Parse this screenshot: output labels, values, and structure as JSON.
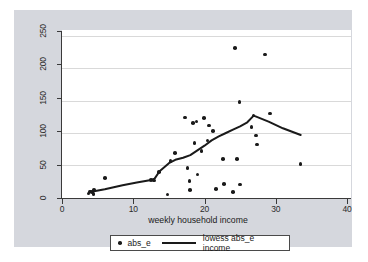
{
  "chart_data": {
    "type": "scatter",
    "title": "",
    "xlabel": "weekly household income",
    "ylabel": "",
    "xlim": [
      0,
      40
    ],
    "ylim": [
      0,
      260
    ],
    "xticks": [
      0,
      10,
      20,
      30,
      40
    ],
    "yticks": [
      0,
      50,
      100,
      150,
      200,
      250
    ],
    "xtick_labels": [
      "0",
      "10",
      "20",
      "30",
      "40"
    ],
    "ytick_labels": [
      "0",
      "50",
      "100",
      "150",
      "200",
      "250"
    ],
    "grid": "horizontal",
    "legend_position": "bottom",
    "series": [
      {
        "name": "abs_e",
        "type": "scatter",
        "marker": "circle",
        "color": "#1a1a1a",
        "points": [
          [
            3.7,
            7
          ],
          [
            3.9,
            10
          ],
          [
            4.2,
            9
          ],
          [
            4.5,
            12
          ],
          [
            4.4,
            6
          ],
          [
            6.0,
            30
          ],
          [
            12.5,
            27
          ],
          [
            12.9,
            26
          ],
          [
            13.6,
            39
          ],
          [
            14.8,
            5
          ],
          [
            15.2,
            55
          ],
          [
            15.9,
            67
          ],
          [
            17.3,
            120
          ],
          [
            17.6,
            45
          ],
          [
            17.9,
            25
          ],
          [
            18.0,
            12
          ],
          [
            18.4,
            112
          ],
          [
            18.6,
            82
          ],
          [
            18.9,
            114
          ],
          [
            19.0,
            35
          ],
          [
            19.6,
            70
          ],
          [
            19.9,
            119
          ],
          [
            20.4,
            86
          ],
          [
            20.6,
            108
          ],
          [
            21.2,
            100
          ],
          [
            21.6,
            13
          ],
          [
            22.6,
            58
          ],
          [
            22.7,
            21
          ],
          [
            24.3,
            224
          ],
          [
            24.0,
            9
          ],
          [
            24.6,
            58
          ],
          [
            24.9,
            143
          ],
          [
            25.0,
            20
          ],
          [
            26.6,
            106
          ],
          [
            26.9,
            123
          ],
          [
            27.2,
            93
          ],
          [
            27.4,
            80
          ],
          [
            28.5,
            214
          ],
          [
            29.2,
            126
          ],
          [
            33.5,
            51
          ]
        ]
      },
      {
        "name": "lowess abs_e income",
        "type": "line",
        "color": "#1a1a1a",
        "points": [
          [
            3.8,
            8
          ],
          [
            4.5,
            10
          ],
          [
            6.0,
            13
          ],
          [
            8.5,
            19
          ],
          [
            10.5,
            23
          ],
          [
            12.5,
            27
          ],
          [
            13.0,
            29
          ],
          [
            13.7,
            40
          ],
          [
            15.0,
            52
          ],
          [
            15.9,
            57
          ],
          [
            17.0,
            60
          ],
          [
            18.0,
            64
          ],
          [
            19.0,
            71
          ],
          [
            20.0,
            78
          ],
          [
            21.0,
            86
          ],
          [
            22.0,
            92
          ],
          [
            23.0,
            97
          ],
          [
            24.0,
            102
          ],
          [
            25.0,
            107
          ],
          [
            26.0,
            113
          ],
          [
            26.9,
            123
          ],
          [
            29.0,
            114
          ],
          [
            31.0,
            104
          ],
          [
            33.5,
            94
          ]
        ]
      }
    ],
    "legend": [
      {
        "label": "abs_e",
        "marker": "circle"
      },
      {
        "label": "lowess abs_e income",
        "marker": "line"
      }
    ],
    "colors": {
      "marker": "#1a1a1a",
      "line": "#1a1a1a",
      "graph_background": "#d5d7dd",
      "plot_background": "#ffffff",
      "gridline": "#d9d9d9",
      "axis": "#3a3a3a"
    }
  }
}
